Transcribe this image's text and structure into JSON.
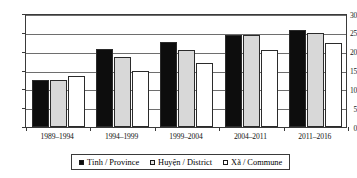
{
  "chart_data": {
    "type": "bar",
    "title": "",
    "xlabel": "",
    "ylabel": "",
    "ylim": [
      0,
      30
    ],
    "yticks": [
      0,
      5,
      10,
      15,
      20,
      25,
      30
    ],
    "grid": true,
    "legend_position": "bottom",
    "categories": [
      "1989–1994",
      "1994–1999",
      "1999–2004",
      "2004–2011",
      "2011–2016"
    ],
    "series": [
      {
        "name": "Tỉnh / Province",
        "color": "#0d0d0d",
        "swatch": "filled-black-square",
        "values": [
          12.3,
          20.5,
          22.5,
          24.1,
          25.5
        ]
      },
      {
        "name": "Huyện / District",
        "color": "#d8d8d8",
        "swatch": "grey-square",
        "values": [
          12.5,
          18.5,
          20.2,
          24.1,
          24.8
        ]
      },
      {
        "name": "Xã / Commune",
        "color": "#ffffff",
        "swatch": "open-square",
        "values": [
          13.4,
          14.7,
          16.9,
          20.3,
          22.1
        ]
      }
    ]
  }
}
